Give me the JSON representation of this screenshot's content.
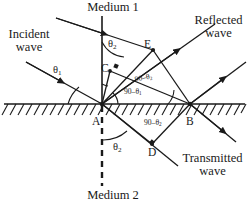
{
  "figure": {
    "width": 249,
    "height": 208,
    "background": "#ffffff",
    "stroke_color": "#1a1a1a",
    "text_color": "#1a1a1a"
  },
  "labels": {
    "medium_top": "Medium 1",
    "medium_bottom": "Medium 2",
    "incident_wave_line1": "Incident",
    "incident_wave_line2": "wave",
    "reflected_wave_line1": "Reflected",
    "reflected_wave_line2": "wave",
    "transmitted_wave_line1": "Transmitted",
    "transmitted_wave_line2": "wave"
  },
  "points": {
    "A": "A",
    "B": "B",
    "C": "C",
    "D": "D",
    "E": "E"
  },
  "angles": {
    "theta1_incident": {
      "base": "θ",
      "sub": "1"
    },
    "theta2_top": {
      "base": "θ",
      "sub": "2"
    },
    "theta2_bottom": {
      "base": "θ",
      "sub": "2"
    },
    "comp_theta2_upper": {
      "base": "90–θ",
      "sub": "2"
    },
    "comp_theta1_lower": {
      "base": "90–θ",
      "sub": "1"
    },
    "comp_theta2_right": {
      "base": "90–θ",
      "sub": "2"
    }
  },
  "geometry": {
    "interface_y": 104,
    "point_A": {
      "x": 102,
      "y": 104
    },
    "point_B": {
      "x": 190,
      "y": 104
    },
    "point_C": {
      "x": 110,
      "y": 71
    },
    "point_D": {
      "x": 152,
      "y": 144
    },
    "point_E": {
      "x": 153,
      "y": 50
    },
    "normal_x": 102,
    "normal_top_y": 16,
    "normal_bottom_y": 188
  }
}
